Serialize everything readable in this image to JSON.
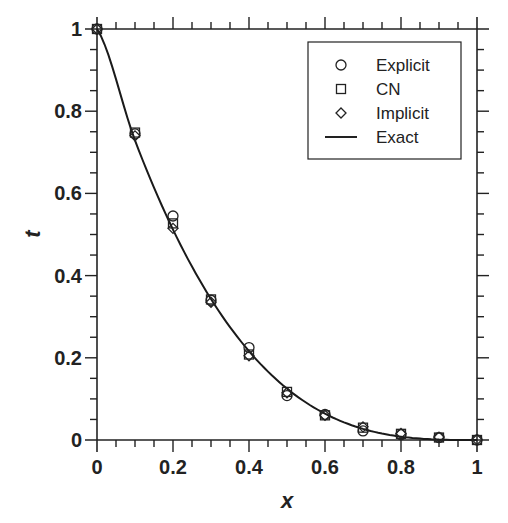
{
  "chart_data": {
    "type": "line",
    "title": "",
    "xlabel": "x",
    "ylabel": "t",
    "xlim": [
      0,
      1
    ],
    "ylim": [
      0,
      1
    ],
    "grid": false,
    "legend_position": "upper right",
    "x_ticks": [
      "0",
      "0.2",
      "0.4",
      "0.6",
      "0.8",
      "1"
    ],
    "y_ticks": [
      "0",
      "0.2",
      "0.4",
      "0.6",
      "0.8",
      "1"
    ],
    "x": [
      0,
      0.1,
      0.2,
      0.3,
      0.4,
      0.5,
      0.6,
      0.7,
      0.8,
      0.9,
      1.0
    ],
    "series": [
      {
        "name": "Explicit",
        "marker": "circle",
        "values": [
          1.0,
          0.745,
          0.545,
          0.34,
          0.225,
          0.108,
          0.062,
          0.022,
          0.013,
          0.006,
          0.0
        ]
      },
      {
        "name": "CN",
        "marker": "square",
        "values": [
          1.0,
          0.748,
          0.527,
          0.342,
          0.208,
          0.117,
          0.06,
          0.03,
          0.015,
          0.006,
          0.0
        ]
      },
      {
        "name": "Implicit",
        "marker": "diamond",
        "values": [
          1.0,
          0.74,
          0.515,
          0.335,
          0.205,
          0.115,
          0.06,
          0.032,
          0.016,
          0.007,
          0.001
        ]
      },
      {
        "name": "Exact",
        "marker": "line",
        "values": [
          1.0,
          0.729,
          0.512,
          0.343,
          0.216,
          0.125,
          0.064,
          0.027,
          0.008,
          0.001,
          0.0
        ]
      }
    ]
  },
  "legend": {
    "items": [
      {
        "label": "Explicit",
        "symbol": "circle"
      },
      {
        "label": "CN",
        "symbol": "square"
      },
      {
        "label": "Implicit",
        "symbol": "diamond"
      },
      {
        "label": "Exact",
        "symbol": "line"
      }
    ]
  },
  "axes": {
    "x_title": "x",
    "y_title": "t"
  },
  "colors": {
    "line": "#1a1a1a",
    "axis": "#222222",
    "background": "#ffffff"
  }
}
